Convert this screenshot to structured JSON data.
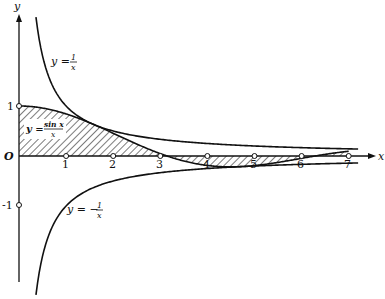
{
  "figure": {
    "axes": {
      "x_label": "x",
      "y_label": "y",
      "origin_label": "O",
      "x_ticks": [
        "1",
        "2",
        "3",
        "4",
        "5",
        "6",
        "7"
      ],
      "y_ticks": [
        "1",
        "-1"
      ]
    },
    "curves": [
      {
        "name": "upper-bound",
        "label_lhs": "y =",
        "label_num": "1",
        "label_den": "x"
      },
      {
        "name": "sinc",
        "label_lhs": "y =",
        "label_num": "sin x",
        "label_den": "x"
      },
      {
        "name": "lower-bound",
        "label_lhs": "y = −",
        "label_num": "1",
        "label_den": "x"
      }
    ],
    "shaded_region": "area between y = sin x / x and the x-axis"
  },
  "chart_data": {
    "type": "line",
    "title": "",
    "xlabel": "x",
    "ylabel": "y",
    "xlim": [
      0,
      7.2
    ],
    "ylim": [
      -2.3,
      3.1
    ],
    "grid": false,
    "series": [
      {
        "name": "y = 1/x",
        "x": [
          0.33,
          0.5,
          1,
          2,
          3,
          4,
          5,
          6,
          7
        ],
        "y": [
          3.0,
          2.0,
          1.0,
          0.5,
          0.333,
          0.25,
          0.2,
          0.167,
          0.143
        ]
      },
      {
        "name": "y = sin x / x",
        "x": [
          0,
          1,
          2,
          3,
          3.1416,
          4,
          5,
          6,
          6.2832,
          7
        ],
        "y": [
          1.0,
          0.841,
          0.455,
          0.047,
          0.0,
          -0.189,
          -0.192,
          -0.047,
          0.0,
          0.094
        ],
        "shaded": true
      },
      {
        "name": "y = -1/x",
        "x": [
          0.5,
          1,
          2,
          3,
          4,
          5,
          6,
          7
        ],
        "y": [
          -2.0,
          -1.0,
          -0.5,
          -0.333,
          -0.25,
          -0.2,
          -0.167,
          -0.143
        ]
      }
    ]
  }
}
